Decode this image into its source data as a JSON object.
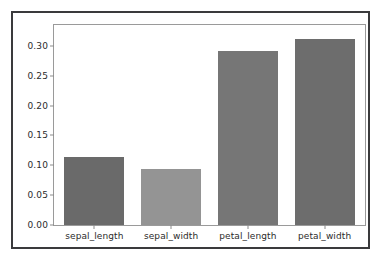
{
  "figure": {
    "frame_color": "#3a3a3c",
    "background": "#ffffff",
    "axes_border_color": "#9a9a9a"
  },
  "chart_data": {
    "type": "bar",
    "title": "",
    "subtitle": "",
    "xlabel": "",
    "ylabel": "",
    "categories": [
      "sepal_length",
      "sepal_width",
      "petal_length",
      "petal_width"
    ],
    "values": [
      0.114,
      0.094,
      0.292,
      0.312
    ],
    "bar_colors": [
      "#6a6a6a",
      "#949494",
      "#767676",
      "#6d6d6d"
    ],
    "ylim": [
      0.0,
      0.335
    ],
    "xlim": [
      -0.5,
      3.5
    ],
    "yticks": [
      0.0,
      0.05,
      0.1,
      0.15,
      0.2,
      0.25,
      0.3
    ],
    "ytick_labels": [
      "0.00",
      "0.05",
      "0.10",
      "0.15",
      "0.20",
      "0.25",
      "0.30"
    ],
    "xtick_labels": [
      "sepal_length",
      "sepal_width",
      "petal_length",
      "petal_width"
    ],
    "grid": false,
    "legend": false,
    "legend_position": "none",
    "annotations": []
  }
}
